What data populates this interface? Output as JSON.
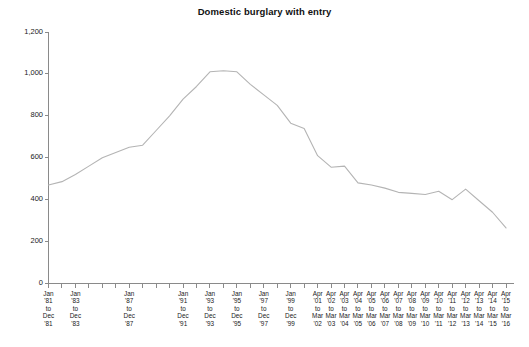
{
  "chart_data": {
    "type": "line",
    "title": "Domestic burglary with entry",
    "xlabel": "",
    "ylabel": "",
    "ylim": [
      0,
      1200
    ],
    "ytick_values": [
      0,
      200,
      400,
      600,
      800,
      1000,
      1200
    ],
    "ytick_labels": [
      "0",
      "200",
      "400",
      "600",
      "800",
      "1,000",
      "1,200"
    ],
    "grid": false,
    "legend": "none",
    "series_color": "#b4b4b4",
    "axis_color": "#8a8a8a",
    "categories": [
      "Jan '81 to Dec '81",
      "Jan '82 to Dec '82",
      "Jan '83 to Dec '83",
      "Jan '84 to Dec '84",
      "Jan '85 to Dec '85",
      "Jan '86 to Dec '86",
      "Jan '87 to Dec '87",
      "Jan '88 to Dec '88",
      "Jan '89 to Dec '89",
      "Jan '90 to Dec '90",
      "Jan '91 to Dec '91",
      "Jan '92 to Dec '92",
      "Jan '93 to Dec '93",
      "Jan '94 to Dec '94",
      "Jan '95 to Dec '95",
      "Jan '96 to Dec '96",
      "Jan '97 to Dec '97",
      "Jan '98 to Dec '98",
      "Jan '99 to Dec '99",
      "Apr '00 to Mar '01",
      "Apr '01 to Mar '02",
      "Apr '02 to Mar '03",
      "Apr '03 to Mar '04",
      "Apr '04 to Mar '05",
      "Apr '05 to Mar '06",
      "Apr '06 to Mar '07",
      "Apr '07 to Mar '08",
      "Apr '08 to Mar '09",
      "Apr '09 to Mar '10",
      "Apr '10 to Mar '11",
      "Apr '11 to Mar '12",
      "Apr '12 to Mar '13",
      "Apr '13 to Mar '14",
      "Apr '14 to Mar '15",
      "Apr '15 to Mar '16"
    ],
    "values": [
      470,
      486,
      520,
      560,
      600,
      625,
      650,
      660,
      730,
      800,
      880,
      940,
      1010,
      1015,
      1010,
      950,
      900,
      850,
      765,
      740,
      610,
      555,
      560,
      480,
      470,
      455,
      435,
      430,
      425,
      440,
      400,
      450,
      395,
      340,
      265
    ],
    "xtick_labels": [
      {
        "index": 0,
        "lines": "Jan\n'81\nto\nDec\n'81"
      },
      {
        "index": 2,
        "lines": "Jan\n'83\nto\nDec\n'83"
      },
      {
        "index": 6,
        "lines": "Jan\n'87\nto\nDec\n'87"
      },
      {
        "index": 10,
        "lines": "Jan\n'91\nto\nDec\n'91"
      },
      {
        "index": 12,
        "lines": "Jan\n'93\nto\nDec\n'93"
      },
      {
        "index": 14,
        "lines": "Jan\n'95\nto\nDec\n'95"
      },
      {
        "index": 16,
        "lines": "Jan\n'97\nto\nDec\n'97"
      },
      {
        "index": 18,
        "lines": "Jan\n'99\nto\nDec\n'99"
      },
      {
        "index": 20,
        "lines": "Apr\n'01\nto\nMar\n'02"
      },
      {
        "index": 21,
        "lines": "Apr\n'02\nto\nMar\n'03"
      },
      {
        "index": 22,
        "lines": "Apr\n'03\nto\nMar\n'04"
      },
      {
        "index": 23,
        "lines": "Apr\n'04\nto\nMar\n'05"
      },
      {
        "index": 24,
        "lines": "Apr\n'05\nto\nMar\n'06"
      },
      {
        "index": 25,
        "lines": "Apr\n'06\nto\nMar\n'07"
      },
      {
        "index": 26,
        "lines": "Apr\n'07\nto\nMar\n'08"
      },
      {
        "index": 27,
        "lines": "Apr\n'08\nto\nMar\n'09"
      },
      {
        "index": 28,
        "lines": "Apr\n'09\nto\nMar\n'10"
      },
      {
        "index": 29,
        "lines": "Apr\n'10\nto\nMar\n'11"
      },
      {
        "index": 30,
        "lines": "Apr\n'11\nto\nMar\n'12"
      },
      {
        "index": 31,
        "lines": "Apr\n'12\nto\nMar\n'13"
      },
      {
        "index": 32,
        "lines": "Apr\n'13\nto\nMar\n'14"
      },
      {
        "index": 33,
        "lines": "Apr\n'14\nto\nMar\n'15"
      },
      {
        "index": 34,
        "lines": "Apr\n'15\nto\nMar\n'16"
      }
    ]
  }
}
